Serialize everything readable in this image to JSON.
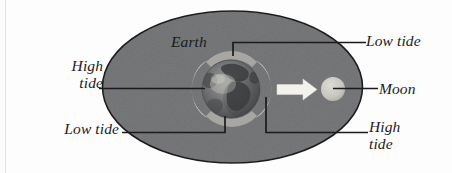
{
  "figure": {
    "labels": {
      "earth": "Earth",
      "moon": "Moon",
      "high_tide_left": "High\ntide",
      "low_tide_left": "Low tide",
      "low_tide_right": "Low tide",
      "high_tide_right": "High\ntide"
    },
    "colors": {
      "background": "#ffffff",
      "ellipse_fill": "#78797b",
      "ellipse_stroke": "#1d1d1d",
      "leader_line": "#1b1b1b",
      "tidal_bulge": "#e6e4dd",
      "earth_body": "#6a6b6d",
      "moon_fill": "#cfcdc6",
      "arrow_fill": "#f2f0ea",
      "text": "#1b1b1b"
    },
    "elements": {
      "ellipse": "water-envelope-ellipse",
      "earth_globe": "earth-globe",
      "tidal_bulges": "tidal-bulge-crescents",
      "arrow": "gravitational-pull-arrow",
      "moon": "moon-circle"
    }
  }
}
